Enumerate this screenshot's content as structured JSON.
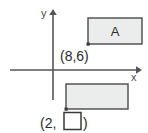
{
  "figure": {
    "type": "coordinate-plane-diagram",
    "background_color": "#ffffff",
    "axes": {
      "x_axis_label": "x",
      "y_axis_label": "y",
      "axis_color": "#555555",
      "origin_px": {
        "x": 53,
        "y": 70
      }
    },
    "shapes": [
      {
        "name": "rectangle-a",
        "label": "A",
        "fill_color": "#ebecec",
        "stroke_color": "#555555",
        "marked_vertex_label": "(8,6)",
        "marked_vertex_position": "bottom-left",
        "px": {
          "x": 88,
          "y": 18,
          "width": 54,
          "height": 26
        }
      },
      {
        "name": "rectangle-b",
        "label": "",
        "fill_color": "#ebecec",
        "stroke_color": "#555555",
        "marked_vertex_label_prefix": "(2,",
        "marked_vertex_label_suffix": ")",
        "marked_vertex_blank": "",
        "marked_vertex_position": "bottom-left",
        "px": {
          "x": 66,
          "y": 84,
          "width": 62,
          "height": 25
        }
      }
    ],
    "labels": {
      "upper_point": "(8,6)",
      "lower_point_prefix": "(2,",
      "lower_point_suffix": ")",
      "lower_point_blank_value": ""
    }
  }
}
